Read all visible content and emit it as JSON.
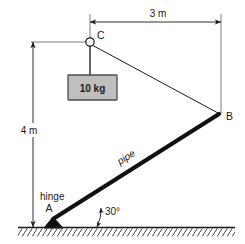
{
  "figure": {
    "background_color": "#ffffff",
    "line_color": "#1a1a1a",
    "pipe_color": "#111111",
    "load_box_fill": "#bfbfbf",
    "load_box_stroke": "#4d4d4d"
  },
  "dimensions": {
    "horizontal": {
      "label": "3 m",
      "value": 3,
      "unit": "m",
      "from_point": "C",
      "to_point": "B"
    },
    "vertical": {
      "label": "4 m",
      "value": 4,
      "unit": "m",
      "from_point": "C",
      "to_point": "ground"
    }
  },
  "points": {
    "a": {
      "label": "A",
      "note_label": "hinge"
    },
    "b": {
      "label": "B"
    },
    "c": {
      "label": "C"
    }
  },
  "members": {
    "pipe": {
      "label": "pipe",
      "from": "A",
      "to": "B"
    },
    "cable": {
      "from": "C",
      "to": "B"
    },
    "hanger": {
      "from": "C",
      "to": "load"
    }
  },
  "load": {
    "label": "10 kg",
    "mass": 10,
    "unit": "kg"
  },
  "angle": {
    "label": "30°",
    "value": 30,
    "unit": "deg",
    "between": "pipe and ground"
  },
  "ground": {
    "label": "ground-hatching"
  }
}
